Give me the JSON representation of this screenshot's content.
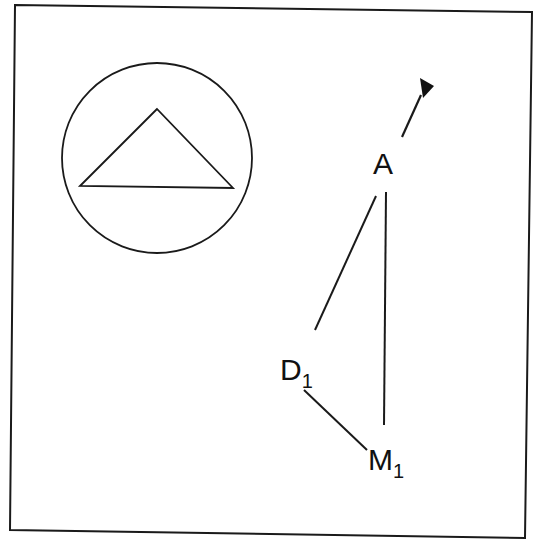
{
  "diagram": {
    "colors": {
      "background": "#ffffff",
      "stroke": "#1a1a1a"
    },
    "frame": {
      "points": [
        [
          15,
          5
        ],
        [
          532,
          12
        ],
        [
          525,
          538
        ],
        [
          10,
          530
        ]
      ]
    },
    "inset": {
      "shape": "circle",
      "center": [
        157,
        158
      ],
      "radius": 95,
      "triangle": [
        [
          157,
          109
        ],
        [
          80,
          186
        ],
        [
          233,
          188
        ]
      ]
    },
    "nodes": [
      {
        "id": "A",
        "label": "A",
        "subscript": "",
        "x": 384,
        "y": 163
      },
      {
        "id": "D1",
        "label": "D",
        "subscript": "1",
        "x": 297,
        "y": 368
      },
      {
        "id": "M1",
        "label": "M",
        "subscript": "1",
        "x": 388,
        "y": 460
      }
    ],
    "edges": [
      {
        "from": "A",
        "to": "D1",
        "x1": 376,
        "y1": 196,
        "x2": 315,
        "y2": 330
      },
      {
        "from": "A",
        "to": "M1",
        "x1": 386,
        "y1": 192,
        "x2": 384,
        "y2": 425
      },
      {
        "from": "D1",
        "to": "M1",
        "x1": 304,
        "y1": 390,
        "x2": 367,
        "y2": 450
      }
    ],
    "arrow": {
      "from": "A",
      "direction": "north-east",
      "x1": 402,
      "y1": 137,
      "x2": 421,
      "y2": 95
    }
  }
}
